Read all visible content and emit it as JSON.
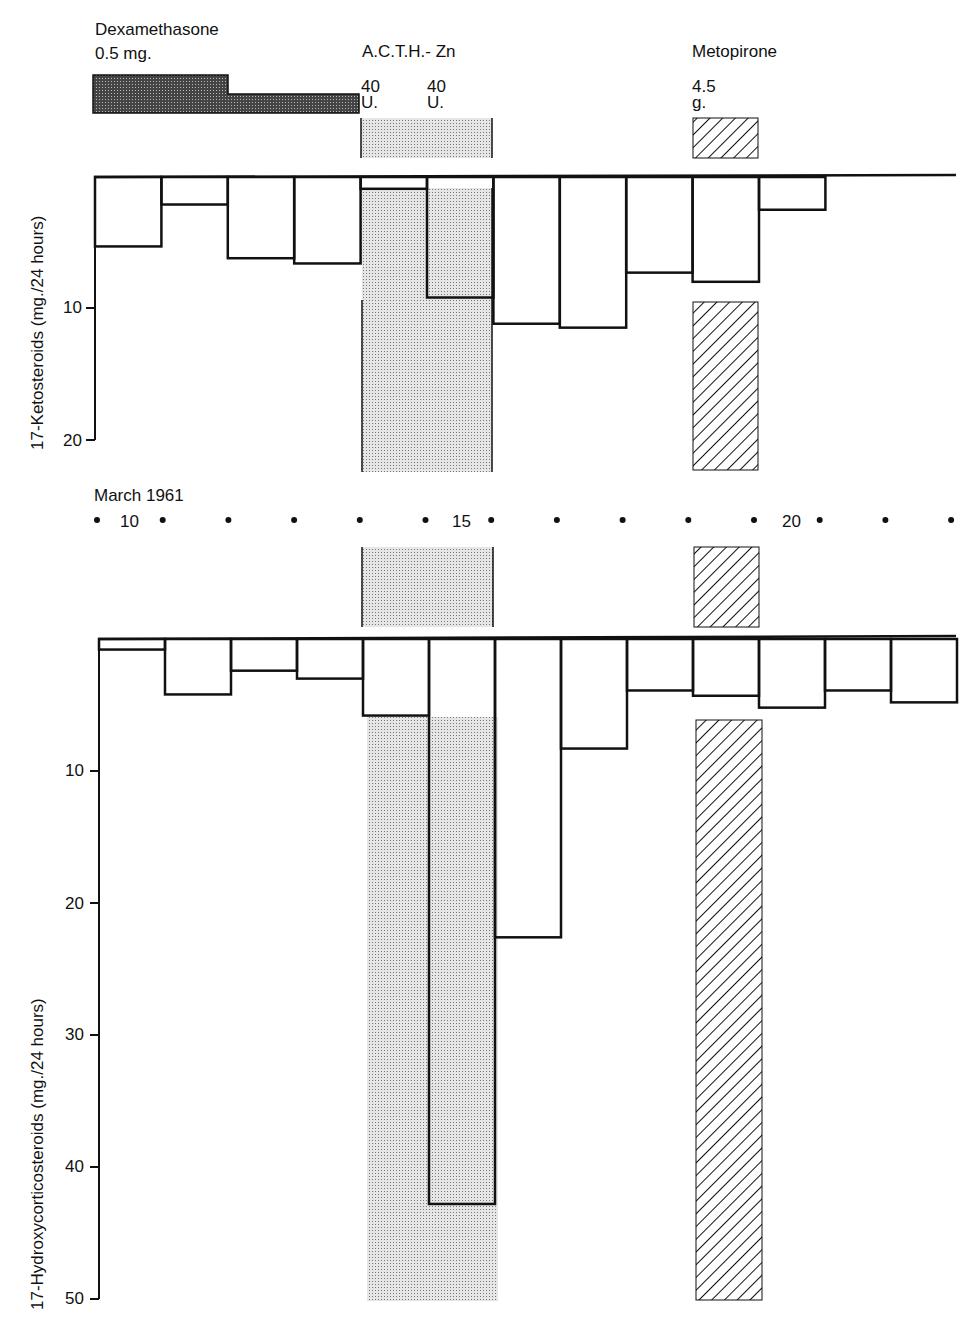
{
  "chart_data": [
    {
      "type": "bar",
      "title": "17-Ketosteroids excretion",
      "xlabel": "March 1961",
      "ylabel": "17-Ketosteroids (mg./24 hours)",
      "categories": [
        "9",
        "10",
        "11",
        "12",
        "13",
        "14",
        "15",
        "16",
        "17",
        "18",
        "19",
        "20",
        "21"
      ],
      "values": [
        5.3,
        2.1,
        6.2,
        6.6,
        0.9,
        9.2,
        11.2,
        11.5,
        7.3,
        8.0,
        2.5,
        null,
        null
      ],
      "ylim": [
        0,
        20
      ],
      "yticks": [
        10,
        20
      ],
      "inverted_axis": true
    },
    {
      "type": "bar",
      "title": "17-Hydroxycorticosteroids excretion",
      "xlabel": "March 1961",
      "ylabel": "17-Hydroxycorticosteroids (mg./24 hours)",
      "categories": [
        "9",
        "10",
        "11",
        "12",
        "13",
        "14",
        "15",
        "16",
        "17",
        "18",
        "19",
        "20",
        "21"
      ],
      "values": [
        0.8,
        4.2,
        2.4,
        3.0,
        5.8,
        42.8,
        22.6,
        8.3,
        3.9,
        4.3,
        5.2,
        3.9,
        4.8
      ],
      "ylim": [
        0,
        50
      ],
      "yticks": [
        10,
        20,
        30,
        40,
        50
      ],
      "inverted_axis": true
    }
  ],
  "treatments": {
    "dexamethasone": {
      "name": "Dexamethasone",
      "dose": "0.5 mg."
    },
    "acth": {
      "name": "A.C.T.H.- Zn",
      "dose1": "40",
      "unit1": "U.",
      "dose2": "40",
      "unit2": "U."
    },
    "metopirone": {
      "name": "Metopirone",
      "dose": "4.5",
      "unit": "g."
    }
  },
  "top_axis": {
    "label": "17-Ketosteroids (mg./24 hours)",
    "ticks": [
      "10",
      "20"
    ]
  },
  "bottom_axis": {
    "label": "17-Hydroxycorticosteroids (mg./24 hours)",
    "ticks": [
      "10",
      "20",
      "30",
      "40",
      "50"
    ]
  },
  "date_axis": {
    "label": "March 1961",
    "day10": "10",
    "day15": "15",
    "day20": "20"
  }
}
